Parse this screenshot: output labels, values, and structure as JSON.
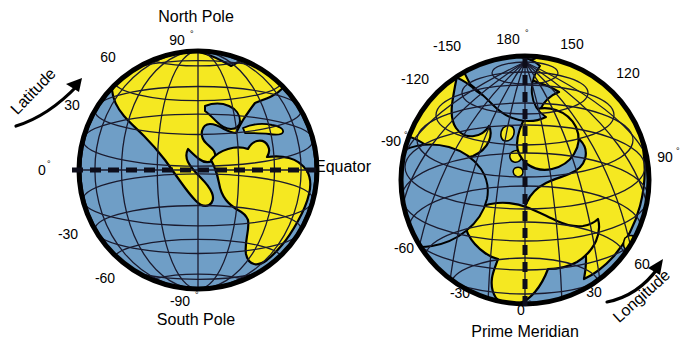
{
  "figure": {
    "colors": {
      "ocean": "#6f9ec6",
      "land": "#f5e821",
      "outline": "#000000",
      "graticule": "#1a1a2e",
      "background": "#ffffff",
      "text": "#000000"
    }
  },
  "left_globe": {
    "name": "latitude-globe",
    "projection": "orthographic-equatorial-americas",
    "axis_label": "Latitude",
    "top_label": "North Pole",
    "bottom_label": "South Pole",
    "equator_label": "Equator",
    "degree_symbol": "°",
    "ticks": [
      {
        "value": "90",
        "degree": true,
        "position": "top"
      },
      {
        "value": "60",
        "degree": false,
        "position": "upper-left"
      },
      {
        "value": "30",
        "degree": false,
        "position": "left-upper"
      },
      {
        "value": "0",
        "degree": true,
        "position": "left-equator"
      },
      {
        "value": "-30",
        "degree": false,
        "position": "left-lower"
      },
      {
        "value": "-60",
        "degree": false,
        "position": "lower-left"
      },
      {
        "value": "-90",
        "degree": true,
        "position": "bottom"
      }
    ],
    "graticule": {
      "parallel_spacing_deg": 15,
      "meridian_spacing_deg": 20
    }
  },
  "right_globe": {
    "name": "longitude-globe",
    "projection": "orthographic-north-polar-africa-europe",
    "axis_label": "Longitude",
    "bottom_label": "Prime Meridian",
    "degree_symbol": "°",
    "ticks": [
      {
        "value": "180",
        "degree": true,
        "position": "top"
      },
      {
        "value": "-150",
        "degree": false,
        "position": "upper-left"
      },
      {
        "value": "150",
        "degree": false,
        "position": "upper-right"
      },
      {
        "value": "-120",
        "degree": false,
        "position": "left-upper"
      },
      {
        "value": "120",
        "degree": false,
        "position": "right-upper"
      },
      {
        "value": "-90",
        "degree": true,
        "position": "left"
      },
      {
        "value": "90",
        "degree": true,
        "position": "right"
      },
      {
        "value": "-60",
        "degree": false,
        "position": "left-lower"
      },
      {
        "value": "60",
        "degree": false,
        "position": "lower-right-arrow"
      },
      {
        "value": "-30",
        "degree": false,
        "position": "bottom-left"
      },
      {
        "value": "30",
        "degree": false,
        "position": "bottom-right"
      },
      {
        "value": "0",
        "degree": true,
        "position": "bottom"
      }
    ],
    "graticule": {
      "parallel_spacing_deg": 15,
      "meridian_spacing_deg": 15
    }
  }
}
